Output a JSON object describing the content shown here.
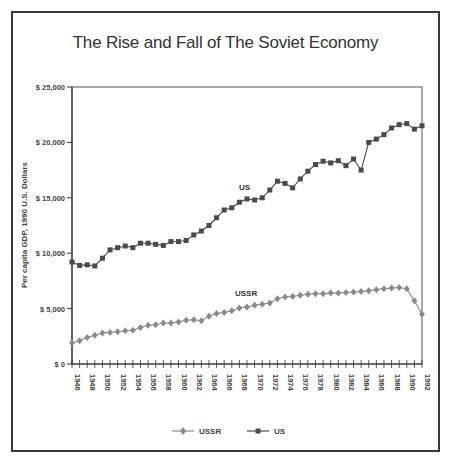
{
  "chart_data": {
    "type": "line",
    "title": "The Rise and Fall of The Soviet Economy",
    "xlabel": "",
    "ylabel": "Per capita GDP, 1990 U.S. Dollars",
    "ylim": [
      0,
      25000
    ],
    "yticks": [
      "$ 0",
      "$ 5,000",
      "$ 10,000",
      "$ 15,000",
      "$ 20,000",
      "$ 25,000"
    ],
    "ytick_values": [
      0,
      5000,
      10000,
      15000,
      20000,
      25000
    ],
    "xlim": [
      1946,
      1992
    ],
    "xtick_labels": [
      "1946",
      "1948",
      "1950",
      "1952",
      "1954",
      "1956",
      "1958",
      "1960",
      "1962",
      "1964",
      "1966",
      "1968",
      "1970",
      "1972",
      "1974",
      "1976",
      "1978",
      "1980",
      "1982",
      "1984",
      "1986",
      "1988",
      "1990",
      "1992"
    ],
    "x": [
      1946,
      1947,
      1948,
      1949,
      1950,
      1951,
      1952,
      1953,
      1954,
      1955,
      1956,
      1957,
      1958,
      1959,
      1960,
      1961,
      1962,
      1963,
      1964,
      1965,
      1966,
      1967,
      1968,
      1969,
      1970,
      1971,
      1972,
      1973,
      1974,
      1975,
      1976,
      1977,
      1978,
      1979,
      1980,
      1981,
      1982,
      1983,
      1984,
      1985,
      1986,
      1987,
      1988,
      1989,
      1990,
      1991,
      1992
    ],
    "series": [
      {
        "name": "USSR",
        "marker": "diamond",
        "color": "#8a8a8a",
        "inline_label": "USSR",
        "values": [
          1900,
          2100,
          2400,
          2600,
          2800,
          2850,
          2900,
          3000,
          3050,
          3300,
          3500,
          3550,
          3700,
          3700,
          3800,
          3950,
          4000,
          3900,
          4300,
          4550,
          4650,
          4800,
          5050,
          5150,
          5300,
          5400,
          5500,
          5900,
          6050,
          6100,
          6200,
          6300,
          6350,
          6350,
          6400,
          6400,
          6450,
          6500,
          6550,
          6600,
          6700,
          6800,
          6850,
          6900,
          6800,
          5700,
          4500
        ]
      },
      {
        "name": "US",
        "marker": "square",
        "color": "#4a4a4a",
        "inline_label": "US",
        "values": [
          9200,
          8900,
          8950,
          8850,
          9550,
          10300,
          10500,
          10650,
          10500,
          10900,
          10900,
          10800,
          10700,
          11050,
          11050,
          11150,
          11650,
          12000,
          12500,
          13200,
          13900,
          14100,
          14600,
          14900,
          14800,
          15000,
          15700,
          16500,
          16300,
          15900,
          16700,
          17400,
          18000,
          18300,
          18150,
          18350,
          17900,
          18500,
          17500,
          20000,
          20300,
          20700,
          21300,
          21600,
          21700,
          21200,
          21500
        ]
      }
    ],
    "grid": false,
    "legend_position": "bottom"
  },
  "legend": {
    "ussr_label": "USSR",
    "us_label": "US"
  }
}
